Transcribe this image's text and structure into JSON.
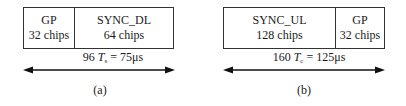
{
  "figure_a": {
    "segments": [
      {
        "name": "GP",
        "chips": "32 chips"
      },
      {
        "name": "SYNC_DL",
        "chips": "64 chips"
      }
    ],
    "duration": {
      "count": "96",
      "symbol": "T",
      "subscript": "s",
      "value": "= 75μs"
    },
    "caption": "(a)"
  },
  "figure_b": {
    "segments": [
      {
        "name": "SYNC_UL",
        "chips": "128 chips"
      },
      {
        "name": "GP",
        "chips": "32 chips"
      }
    ],
    "duration": {
      "count": "160",
      "symbol": "T",
      "subscript": "c",
      "value": "= 125μs"
    },
    "caption": "(b)"
  },
  "colors": {
    "line": "#333333",
    "text": "#1a1a1a",
    "background": "#ffffff"
  }
}
